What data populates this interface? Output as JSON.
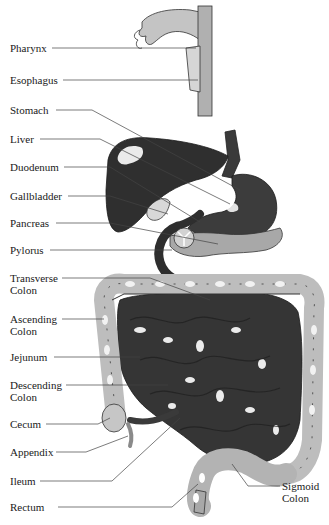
{
  "diagram": {
    "colors": {
      "background": "#ffffff",
      "dark_organ": "#3a3a3a",
      "mid_organ": "#5a5a5a",
      "light_organ": "#b8b8b8",
      "colon": "#c9c9c9",
      "line": "#444444",
      "text": "#1a1a1a"
    },
    "labels": [
      {
        "id": "pharynx",
        "text": "Pharynx",
        "x": 10,
        "y": 42
      },
      {
        "id": "esophagus",
        "text": "Esophagus",
        "x": 10,
        "y": 74
      },
      {
        "id": "stomach",
        "text": "Stomach",
        "x": 10,
        "y": 104
      },
      {
        "id": "liver",
        "text": "Liver",
        "x": 10,
        "y": 133
      },
      {
        "id": "duodenum",
        "text": "Duodenum",
        "x": 10,
        "y": 161
      },
      {
        "id": "gallbladder",
        "text": "Gallbladder",
        "x": 10,
        "y": 190
      },
      {
        "id": "pancreas",
        "text": "Pancreas",
        "x": 10,
        "y": 217
      },
      {
        "id": "pylorus",
        "text": "Pylorus",
        "x": 10,
        "y": 244
      },
      {
        "id": "transverse_colon",
        "text": "Transverse\nColon",
        "x": 10,
        "y": 272
      },
      {
        "id": "ascending_colon",
        "text": "Ascending\nColon",
        "x": 10,
        "y": 313
      },
      {
        "id": "jejunum",
        "text": "Jejunum",
        "x": 10,
        "y": 351
      },
      {
        "id": "descending_colon",
        "text": "Descending\nColon",
        "x": 10,
        "y": 379
      },
      {
        "id": "cecum",
        "text": "Cecum",
        "x": 10,
        "y": 418
      },
      {
        "id": "appendix",
        "text": "Appendix",
        "x": 10,
        "y": 446
      },
      {
        "id": "ileum",
        "text": "Ileum",
        "x": 10,
        "y": 475
      },
      {
        "id": "rectum",
        "text": "Rectum",
        "x": 10,
        "y": 501
      },
      {
        "id": "sigmoid_colon",
        "text": "Sigmoid\nColon",
        "x": 282,
        "y": 480
      }
    ]
  }
}
